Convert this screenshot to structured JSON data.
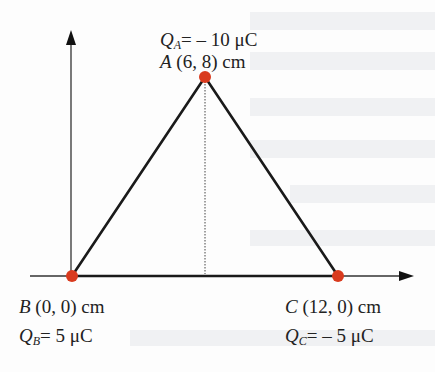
{
  "diagram": {
    "type": "triangle-of-point-charges",
    "colors": {
      "charge": "#d93a1e",
      "line": "#1a1a1a",
      "axis": "#333333"
    },
    "points": {
      "A": {
        "name": "A",
        "coords": "(6, 8) cm",
        "charge_symbol": "Q",
        "charge_sub": "A",
        "charge_value": "= – 10 μC"
      },
      "B": {
        "name": "B",
        "coords": "(0, 0) cm",
        "charge_symbol": "Q",
        "charge_sub": "B",
        "charge_value": "= 5 μC"
      },
      "C": {
        "name": "C",
        "coords": "(12, 0) cm",
        "charge_symbol": "Q",
        "charge_sub": "C",
        "charge_value": "= – 5 μC"
      }
    }
  }
}
